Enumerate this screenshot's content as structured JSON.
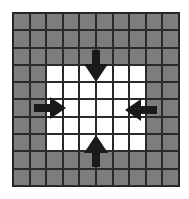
{
  "diagram": {
    "title": "",
    "grid": {
      "columns": 10,
      "rows": 10
    },
    "white_region": {
      "col_start": 2,
      "col_end": 7,
      "row_start": 3,
      "row_end": 7
    },
    "colors": {
      "shaded": "#9a9a9a",
      "white": "#ffffff",
      "lines": "#2a2a2a",
      "arrows": "#1a1a1a"
    },
    "arrows": [
      {
        "name": "arrow-down",
        "direction": "down",
        "position": "top-center"
      },
      {
        "name": "arrow-right",
        "direction": "right",
        "position": "left-middle"
      },
      {
        "name": "arrow-left",
        "direction": "left",
        "position": "right-middle"
      },
      {
        "name": "arrow-up",
        "direction": "up",
        "position": "bottom-center"
      }
    ]
  }
}
